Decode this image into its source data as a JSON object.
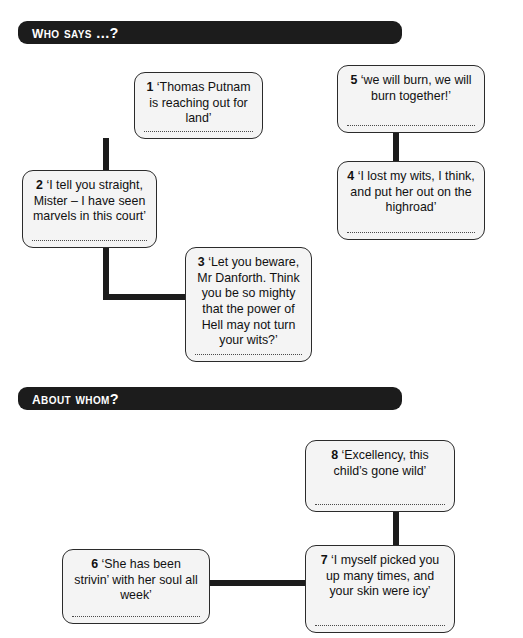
{
  "worksheet": {
    "sections": [
      {
        "id": "who-says",
        "heading": "Who says ...?",
        "boxes": [
          {
            "number": "1",
            "quote": "‘Thomas Putnam is reaching out for land’"
          },
          {
            "number": "2",
            "quote": "‘I tell you straight, Mister – I have seen marvels in this court’"
          },
          {
            "number": "3",
            "quote": "‘Let you beware, Mr Danforth. Think you be so mighty that the power of Hell may not turn your wits?’"
          },
          {
            "number": "4",
            "quote": "‘I lost my wits, I think, and put her out on the highroad’"
          },
          {
            "number": "5",
            "quote": "‘we will burn, we will burn together!’"
          }
        ]
      },
      {
        "id": "about-whom",
        "heading": "About whom?",
        "boxes": [
          {
            "number": "6",
            "quote": "‘She has been strivin’ with her soul all week’"
          },
          {
            "number": "7",
            "quote": "‘I myself picked you up many times, and your skin were icy’"
          },
          {
            "number": "8",
            "quote": "‘Excellency, this child’s gone wild’"
          }
        ]
      }
    ]
  },
  "colors": {
    "banner_background": "#1c1c1c",
    "banner_text": "#ffffff",
    "box_background": "#f4f4f4",
    "box_border": "#2b2b2b",
    "connector": "#1c1c1c"
  }
}
